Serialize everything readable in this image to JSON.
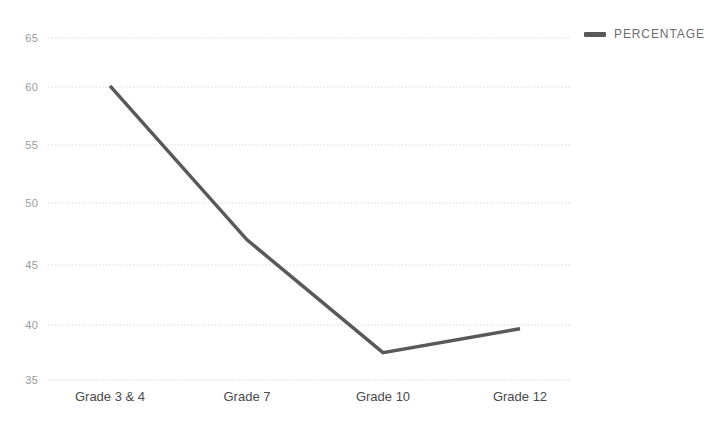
{
  "chart_data": {
    "type": "line",
    "title": "",
    "subtitle": "",
    "xlabel": "",
    "ylabel": "",
    "categories": [
      "Grade 3 & 4",
      "Grade 7",
      "Grade 10",
      "Grade 12"
    ],
    "series": [
      {
        "name": "PERCENTAGE",
        "color": "#595959",
        "values": [
          60.8,
          47.3,
          37.4,
          39.5
        ]
      }
    ],
    "ylim": [
      35,
      65
    ],
    "yticks": [
      35,
      40,
      45,
      50,
      55,
      60,
      65
    ],
    "ytick_labels": [
      "35",
      "40",
      "45",
      "50",
      "55",
      "60",
      "65"
    ],
    "grid": true,
    "grid_axis": "y",
    "grid_style": "dotted",
    "grid_color": "#d9d9d9",
    "legend_position": "top-right",
    "legend": [
      {
        "label": "PERCENTAGE",
        "color": "#595959"
      }
    ],
    "background": "#ffffff",
    "axis_line_visible": false,
    "markers": false,
    "line_width": 3.5
  },
  "legend": {
    "entries": [
      {
        "label": "PERCENTAGE",
        "swatch_name": "legend-swatch-percentage"
      }
    ]
  }
}
